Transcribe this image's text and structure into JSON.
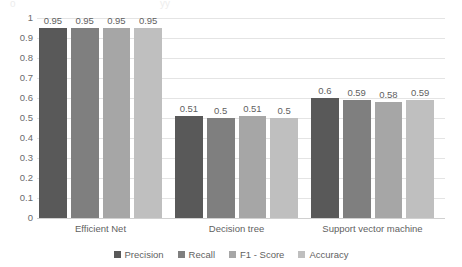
{
  "title_remnant": {
    "fragment_left": "o",
    "fragment_right": "yy"
  },
  "chart_data": {
    "type": "bar",
    "title": "",
    "xlabel": "",
    "ylabel": "",
    "ylim": [
      0,
      1
    ],
    "ytick_step": 0.1,
    "ytick_labels": [
      "1",
      "0.9",
      "0.8",
      "0.7",
      "0.6",
      "0.5",
      "0.4",
      "0.3",
      "0.2",
      "0.1",
      "0"
    ],
    "ytick_values": [
      1,
      0.9,
      0.8,
      0.7,
      0.6,
      0.5,
      0.4,
      0.3,
      0.2,
      0.1,
      0
    ],
    "grid": true,
    "legend_position": "bottom-center",
    "categories": [
      "Efficient Net",
      "Decision tree",
      "Support vector machine"
    ],
    "series": [
      {
        "name": "Precision",
        "color": "#595959",
        "values": [
          0.95,
          0.51,
          0.6
        ],
        "labels": [
          "0.95",
          "0.51",
          "0.6"
        ]
      },
      {
        "name": "Recall",
        "color": "#7f7f7f",
        "values": [
          0.95,
          0.5,
          0.59
        ],
        "labels": [
          "0.95",
          "0.5",
          "0.59"
        ]
      },
      {
        "name": "F1 - Score",
        "color": "#a6a6a6",
        "values": [
          0.95,
          0.51,
          0.58
        ],
        "labels": [
          "0.95",
          "0.51",
          "0.58"
        ]
      },
      {
        "name": "Accuracy",
        "color": "#bfbfbf",
        "values": [
          0.95,
          0.5,
          0.59
        ],
        "labels": [
          "0.95",
          "0.5",
          "0.59"
        ]
      }
    ]
  }
}
